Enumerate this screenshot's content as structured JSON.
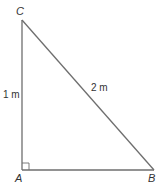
{
  "diagram": {
    "type": "right-triangle",
    "stroke_color": "#6e6e6e",
    "vertices": [
      {
        "name": "C",
        "x": 22,
        "y": 20
      },
      {
        "name": "A",
        "x": 22,
        "y": 170
      },
      {
        "name": "B",
        "x": 154,
        "y": 170
      }
    ],
    "right_angle_at": "A",
    "labels": {
      "C": "C",
      "A": "A",
      "B": "B",
      "side_AC": "1 m",
      "side_CB": "2 m"
    }
  }
}
